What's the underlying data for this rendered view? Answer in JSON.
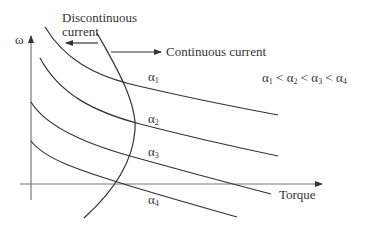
{
  "diagram": {
    "axes": {
      "y_label": "ω",
      "x_label": "Torque"
    },
    "annotations": {
      "discontinuous_line1": "Discontinuous",
      "discontinuous_line2": "current",
      "continuous": "Continuous current",
      "inequality": {
        "a1": "α",
        "s1": "1",
        "lt1": " < ",
        "a2": "α",
        "s2": "2",
        "lt2": " < ",
        "a3": "α",
        "s3": "3",
        "lt3": " < ",
        "a4": "α",
        "s4": "4"
      }
    },
    "curves": [
      {
        "name": "α",
        "sub": "1"
      },
      {
        "name": "α",
        "sub": "2"
      },
      {
        "name": "α",
        "sub": "3"
      },
      {
        "name": "α",
        "sub": "4"
      }
    ],
    "colors": {
      "line": "#333333",
      "axis": "#777777",
      "background": "#ffffff"
    }
  }
}
